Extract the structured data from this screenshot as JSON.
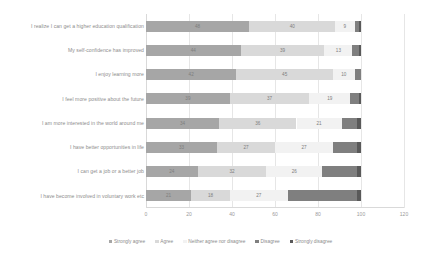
{
  "chart_data": {
    "type": "bar",
    "subtype": "stacked-horizontal-100",
    "title": "",
    "xlabel": "",
    "ylabel": "",
    "xlim": [
      0,
      120
    ],
    "xticks": [
      0,
      20,
      40,
      60,
      80,
      100,
      120
    ],
    "grid": true,
    "legend_position": "bottom",
    "categories": [
      "I realize I can get a higher education qualification",
      "My self-confidence has improved",
      "I enjoy learning more",
      "I feel more positive about the future",
      "I am more interested in the world around me",
      "I have better opportunities in life",
      "I can get a job or a better job",
      "I have become involved in voluntary work etc"
    ],
    "series": [
      {
        "name": "Strongly agree",
        "color": "#a6a6a6",
        "values": [
          48,
          44,
          42,
          39,
          34,
          33,
          24,
          21
        ]
      },
      {
        "name": "Agree",
        "color": "#d9d9d9",
        "values": [
          40,
          39,
          45,
          37,
          36,
          27,
          32,
          18
        ]
      },
      {
        "name": "Neither agree nor disagree",
        "color": "#f2f2f2",
        "values": [
          9,
          13,
          10,
          19,
          21,
          27,
          26,
          27
        ]
      },
      {
        "name": "Disagree",
        "color": "#7f7f7f",
        "values": [
          2,
          3,
          3,
          4,
          7,
          11,
          16,
          32
        ]
      },
      {
        "name": "Strongly disagree",
        "color": "#595959",
        "values": [
          1,
          1,
          0,
          1,
          2,
          2,
          2,
          2
        ]
      }
    ],
    "value_labels": [
      [
        "48",
        "40",
        "9",
        "",
        ""
      ],
      [
        "44",
        "39",
        "13",
        "",
        ""
      ],
      [
        "42",
        "45",
        "10",
        "",
        ""
      ],
      [
        "39",
        "37",
        "19",
        "",
        ""
      ],
      [
        "34",
        "36",
        "21",
        "",
        ""
      ],
      [
        "33",
        "27",
        "27",
        "",
        ""
      ],
      [
        "24",
        "32",
        "26",
        "",
        ""
      ],
      [
        "21",
        "18",
        "27",
        "",
        ""
      ]
    ]
  },
  "colors": {
    "gridline": "#e6e6e6",
    "axis": "#d9d9d9",
    "text": "#8c8c8c",
    "background": "#ffffff"
  }
}
